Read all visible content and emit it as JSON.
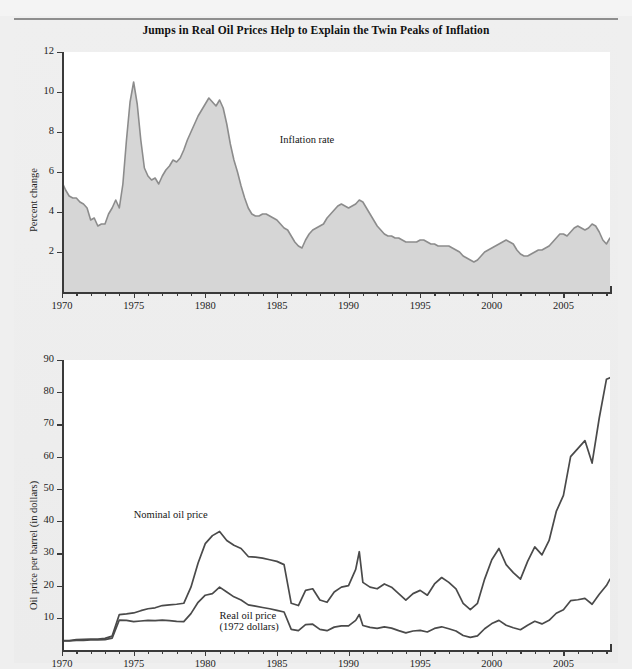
{
  "figure": {
    "title": "Jumps in Real Oil Prices Help to Explain the Twin Peaks of Inflation"
  },
  "chart_data": [
    {
      "type": "area",
      "title": "Inflation rate",
      "xlabel": "",
      "ylabel": "Percent change",
      "xlim": [
        1970,
        2008.25
      ],
      "ylim": [
        0,
        12
      ],
      "yticks": [
        2,
        4,
        6,
        8,
        10,
        12
      ],
      "xticks": [
        1970,
        1975,
        1980,
        1985,
        1990,
        1995,
        2000,
        2005
      ],
      "xtick_minor_step": 1,
      "grid": false,
      "legend_position": "inline-annotation",
      "series": [
        {
          "name": "Inflation rate",
          "fill_color": "#d6d6d6",
          "line_color": "#8c8c8c",
          "x": [
            1970.0,
            1970.25,
            1970.5,
            1970.75,
            1971.0,
            1971.25,
            1971.5,
            1971.75,
            1972.0,
            1972.25,
            1972.5,
            1972.75,
            1973.0,
            1973.25,
            1973.5,
            1973.75,
            1974.0,
            1974.25,
            1974.5,
            1974.75,
            1975.0,
            1975.25,
            1975.5,
            1975.75,
            1976.0,
            1976.25,
            1976.5,
            1976.75,
            1977.0,
            1977.25,
            1977.5,
            1977.75,
            1978.0,
            1978.25,
            1978.5,
            1978.75,
            1979.0,
            1979.25,
            1979.5,
            1979.75,
            1980.0,
            1980.25,
            1980.5,
            1980.75,
            1981.0,
            1981.25,
            1981.5,
            1981.75,
            1982.0,
            1982.25,
            1982.5,
            1982.75,
            1983.0,
            1983.25,
            1983.5,
            1983.75,
            1984.0,
            1984.25,
            1984.5,
            1984.75,
            1985.0,
            1985.25,
            1985.5,
            1985.75,
            1986.0,
            1986.25,
            1986.5,
            1986.75,
            1987.0,
            1987.25,
            1987.5,
            1987.75,
            1988.0,
            1988.25,
            1988.5,
            1988.75,
            1989.0,
            1989.25,
            1989.5,
            1989.75,
            1990.0,
            1990.25,
            1990.5,
            1990.75,
            1991.0,
            1991.25,
            1991.5,
            1991.75,
            1992.0,
            1992.25,
            1992.5,
            1992.75,
            1993.0,
            1993.25,
            1993.5,
            1993.75,
            1994.0,
            1994.25,
            1994.5,
            1994.75,
            1995.0,
            1995.25,
            1995.5,
            1995.75,
            1996.0,
            1996.25,
            1996.5,
            1996.75,
            1997.0,
            1997.25,
            1997.5,
            1997.75,
            1998.0,
            1998.25,
            1998.5,
            1998.75,
            1999.0,
            1999.25,
            1999.5,
            1999.75,
            2000.0,
            2000.25,
            2000.5,
            2000.75,
            2001.0,
            2001.25,
            2001.5,
            2001.75,
            2002.0,
            2002.25,
            2002.5,
            2002.75,
            2003.0,
            2003.25,
            2003.5,
            2003.75,
            2004.0,
            2004.25,
            2004.5,
            2004.75,
            2005.0,
            2005.25,
            2005.5,
            2005.75,
            2006.0,
            2006.25,
            2006.5,
            2006.75,
            2007.0,
            2007.25,
            2007.5,
            2007.75,
            2008.0,
            2008.25
          ],
          "values": [
            5.5,
            5.1,
            4.8,
            4.7,
            4.7,
            4.5,
            4.4,
            4.2,
            3.6,
            3.7,
            3.3,
            3.4,
            3.4,
            3.9,
            4.2,
            4.6,
            4.2,
            5.4,
            7.6,
            9.5,
            10.5,
            9.4,
            7.6,
            6.2,
            5.8,
            5.6,
            5.7,
            5.4,
            5.8,
            6.1,
            6.3,
            6.6,
            6.5,
            6.7,
            7.1,
            7.6,
            8.0,
            8.4,
            8.8,
            9.1,
            9.4,
            9.7,
            9.5,
            9.3,
            9.6,
            9.2,
            8.4,
            7.4,
            6.6,
            6.0,
            5.3,
            4.7,
            4.2,
            3.9,
            3.8,
            3.8,
            3.9,
            3.9,
            3.8,
            3.7,
            3.6,
            3.4,
            3.2,
            3.1,
            2.8,
            2.5,
            2.3,
            2.2,
            2.6,
            2.9,
            3.1,
            3.2,
            3.3,
            3.4,
            3.7,
            3.9,
            4.1,
            4.3,
            4.4,
            4.3,
            4.2,
            4.3,
            4.4,
            4.6,
            4.5,
            4.2,
            3.9,
            3.6,
            3.3,
            3.1,
            2.9,
            2.8,
            2.8,
            2.7,
            2.7,
            2.6,
            2.5,
            2.5,
            2.5,
            2.5,
            2.6,
            2.6,
            2.5,
            2.4,
            2.4,
            2.3,
            2.3,
            2.3,
            2.3,
            2.2,
            2.1,
            2.0,
            1.8,
            1.7,
            1.6,
            1.5,
            1.6,
            1.8,
            2.0,
            2.1,
            2.2,
            2.3,
            2.4,
            2.5,
            2.6,
            2.5,
            2.4,
            2.1,
            1.9,
            1.8,
            1.8,
            1.9,
            2.0,
            2.1,
            2.1,
            2.2,
            2.3,
            2.5,
            2.7,
            2.9,
            2.9,
            2.8,
            3.0,
            3.2,
            3.3,
            3.2,
            3.1,
            3.2,
            3.4,
            3.3,
            3.0,
            2.6,
            2.4,
            2.7
          ]
        }
      ],
      "annotations": [
        {
          "text": "Inflation rate",
          "x": 1985.2,
          "y": 7.6
        }
      ]
    },
    {
      "type": "line",
      "title": "",
      "xlabel": "",
      "ylabel": "Oil price per barrel (in dollars)",
      "xlim": [
        1970,
        2008.25
      ],
      "ylim": [
        0,
        90
      ],
      "yticks": [
        10,
        20,
        30,
        40,
        50,
        60,
        70,
        80,
        90
      ],
      "xticks": [
        1970,
        1975,
        1980,
        1985,
        1990,
        1995,
        2000,
        2005
      ],
      "xtick_minor_step": 1,
      "grid": false,
      "legend_position": "inline-annotation",
      "series": [
        {
          "name": "Nominal oil price",
          "line_color": "#4a4a4a",
          "x": [
            1970.0,
            1970.5,
            1971.0,
            1971.5,
            1972.0,
            1972.5,
            1973.0,
            1973.5,
            1974.0,
            1974.5,
            1975.0,
            1975.5,
            1976.0,
            1976.5,
            1977.0,
            1977.5,
            1978.0,
            1978.5,
            1979.0,
            1979.5,
            1980.0,
            1980.5,
            1981.0,
            1981.5,
            1982.0,
            1982.5,
            1983.0,
            1983.5,
            1984.0,
            1984.5,
            1985.0,
            1985.5,
            1986.0,
            1986.5,
            1987.0,
            1987.5,
            1988.0,
            1988.5,
            1989.0,
            1989.5,
            1990.0,
            1990.5,
            1990.75,
            1991.0,
            1991.5,
            1992.0,
            1992.5,
            1993.0,
            1993.5,
            1994.0,
            1994.5,
            1995.0,
            1995.5,
            1996.0,
            1996.5,
            1997.0,
            1997.5,
            1998.0,
            1998.5,
            1999.0,
            1999.5,
            2000.0,
            2000.5,
            2001.0,
            2001.5,
            2002.0,
            2002.5,
            2003.0,
            2003.5,
            2004.0,
            2004.5,
            2005.0,
            2005.5,
            2006.0,
            2006.5,
            2007.0,
            2007.5,
            2008.0,
            2008.25
          ],
          "values": [
            2.9,
            2.9,
            3.2,
            3.3,
            3.4,
            3.4,
            3.6,
            4.3,
            11.0,
            11.2,
            11.5,
            12.2,
            12.8,
            13.1,
            13.8,
            14.0,
            14.2,
            14.5,
            19.5,
            27.0,
            33.0,
            35.5,
            36.8,
            34.0,
            32.5,
            31.5,
            29.0,
            28.8,
            28.5,
            28.0,
            27.5,
            26.5,
            14.5,
            13.8,
            18.5,
            19.0,
            15.5,
            14.8,
            18.0,
            19.5,
            20.0,
            25.0,
            30.5,
            21.0,
            19.5,
            19.0,
            20.5,
            19.5,
            17.5,
            15.5,
            17.5,
            18.5,
            17.0,
            20.5,
            22.5,
            21.0,
            19.0,
            14.5,
            12.5,
            14.5,
            22.0,
            28.0,
            31.5,
            26.5,
            24.0,
            22.0,
            27.5,
            32.0,
            29.5,
            34.0,
            43.0,
            48.0,
            60.0,
            62.5,
            65.0,
            58.0,
            72.0,
            84.0,
            84.5
          ]
        },
        {
          "name": "Real oil price (1972 dollars)",
          "line_color": "#4a4a4a",
          "x": [
            1970.0,
            1970.5,
            1971.0,
            1971.5,
            1972.0,
            1972.5,
            1973.0,
            1973.5,
            1974.0,
            1974.5,
            1975.0,
            1975.5,
            1976.0,
            1976.5,
            1977.0,
            1977.5,
            1978.0,
            1978.5,
            1979.0,
            1979.5,
            1980.0,
            1980.5,
            1981.0,
            1981.5,
            1982.0,
            1982.5,
            1983.0,
            1983.5,
            1984.0,
            1984.5,
            1985.0,
            1985.5,
            1986.0,
            1986.5,
            1987.0,
            1987.5,
            1988.0,
            1988.5,
            1989.0,
            1989.5,
            1990.0,
            1990.5,
            1990.75,
            1991.0,
            1991.5,
            1992.0,
            1992.5,
            1993.0,
            1993.5,
            1994.0,
            1994.5,
            1995.0,
            1995.5,
            1996.0,
            1996.5,
            1997.0,
            1997.5,
            1998.0,
            1998.5,
            1999.0,
            1999.5,
            2000.0,
            2000.5,
            2001.0,
            2001.5,
            2002.0,
            2002.5,
            2003.0,
            2003.5,
            2004.0,
            2004.5,
            2005.0,
            2005.5,
            2006.0,
            2006.5,
            2007.0,
            2007.5,
            2008.0,
            2008.25
          ],
          "values": [
            2.8,
            2.8,
            3.0,
            3.0,
            3.1,
            3.1,
            3.2,
            3.7,
            9.3,
            9.2,
            8.8,
            9.0,
            9.2,
            9.1,
            9.3,
            9.1,
            8.9,
            8.8,
            11.3,
            14.8,
            17.0,
            17.5,
            19.5,
            18.0,
            16.5,
            15.5,
            14.0,
            13.6,
            13.2,
            12.8,
            12.3,
            11.8,
            6.4,
            6.0,
            7.9,
            8.0,
            6.4,
            6.0,
            7.1,
            7.5,
            7.5,
            9.2,
            11.0,
            7.6,
            7.0,
            6.7,
            7.2,
            6.8,
            6.0,
            5.3,
            5.9,
            6.1,
            5.6,
            6.7,
            7.2,
            6.6,
            5.9,
            4.5,
            3.9,
            4.4,
            6.6,
            8.2,
            9.2,
            7.7,
            6.9,
            6.3,
            7.7,
            8.9,
            8.1,
            9.2,
            11.4,
            12.5,
            15.3,
            15.6,
            16.0,
            14.2,
            17.3,
            20.0,
            22.0
          ]
        }
      ],
      "annotations": [
        {
          "text": "Nominal oil price",
          "x": 1975.0,
          "y": 42.0
        },
        {
          "text": "Real oil price",
          "x": 1981.0,
          "y": 10.5
        },
        {
          "text": "(1972 dollars)",
          "x": 1981.0,
          "y": 7.0
        }
      ]
    }
  ]
}
